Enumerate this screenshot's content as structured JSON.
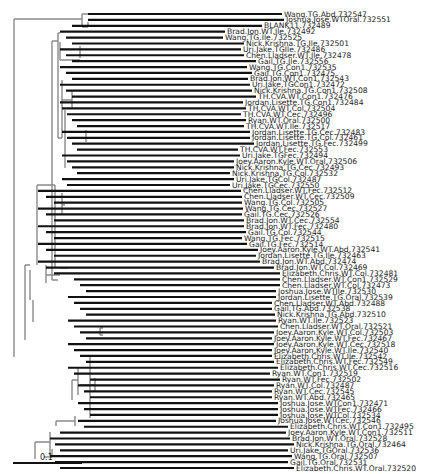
{
  "figure": {
    "type": "phylogenetic-tree",
    "scale_bar": {
      "label": "0.1"
    },
    "colors": {
      "branch": "#111111",
      "internal_branch": "#8a8a8a",
      "label": "#1a1a1a"
    },
    "leaves": [
      {
        "label": "Wang.TG.Abd.732547",
        "len": 282
      },
      {
        "label": "Joshua.Jose.WTOral.732551",
        "len": 284
      },
      {
        "label": "BLANK11.732489",
        "len": 262
      },
      {
        "label": "Brad.Jon.WT.Ile.732492",
        "len": 225
      },
      {
        "label": "Wang.TG.Ile.732525",
        "len": 223
      },
      {
        "label": "Nick.Krishna.TG.Ile.732501",
        "len": 244
      },
      {
        "label": "Uri.Jake.TGIle.732486",
        "len": 241
      },
      {
        "label": "Chen.Lladser.WT.Ile.732478",
        "len": 244
      },
      {
        "label": "Gail.TG.Ile.732556",
        "len": 256
      },
      {
        "label": "Wang.TG.Con1.732535",
        "len": 247
      },
      {
        "label": "Gail.TG.Con1.732475",
        "len": 252
      },
      {
        "label": "Brad.Jon.WT.Con1.732543",
        "len": 248
      },
      {
        "label": "Uri.Jake.TGCon1.732472",
        "len": 250
      },
      {
        "label": "Nick.Krishna.TG.Con1.732508",
        "len": 252
      },
      {
        "label": "TH.CVA.WT.Con1.732476",
        "len": 256
      },
      {
        "label": "Jordan.Lisette.TG.Con1.732484",
        "len": 243
      },
      {
        "label": "TH.CVA.WT.Col.732504",
        "len": 246
      },
      {
        "label": "TH.CVA.WT.Cec.732496",
        "len": 241
      },
      {
        "label": "Ryan.WT.Oral.732500",
        "len": 246
      },
      {
        "label": "TH.CVA.WT.Ile.732517",
        "len": 244
      },
      {
        "label": "Jordan.Lisette.TG.Cec.732483",
        "len": 250
      },
      {
        "label": "Jordan.Lisette.TG.Col.732461",
        "len": 250
      },
      {
        "label": "Jordan.Lisette.TG.Fec.732499",
        "len": 254
      },
      {
        "label": "TH.CVA.WT.Fec.732553",
        "len": 238
      },
      {
        "label": "Uri.Jake.TGFec.732494",
        "len": 240
      },
      {
        "label": "Joey.Aaron.Kyle.WT.Oral.732506",
        "len": 234
      },
      {
        "label": "Nick.Krishna.TG.Cec.732493",
        "len": 234
      },
      {
        "label": "Nick.Krishna.TG.Col.732532",
        "len": 230
      },
      {
        "label": "Uri.Jake.TGCol.732487",
        "len": 234
      },
      {
        "label": "Uri.Jake.TGCec.732550",
        "len": 230
      },
      {
        "label": "Chen.Lladser.WT.Fec.732512",
        "len": 241
      },
      {
        "label": "Chen.Lladser.WT.Cec.732509",
        "len": 242
      },
      {
        "label": "Wang.TG.Col.732505",
        "len": 242
      },
      {
        "label": "Wang.TG.Cec.732527",
        "len": 243
      },
      {
        "label": "Gail.TG.Cec.732526",
        "len": 242
      },
      {
        "label": "Brad.Jon.WT.Cec.732554",
        "len": 244
      },
      {
        "label": "Brad.Jon.WT.Fec.732480",
        "len": 244
      },
      {
        "label": "Gail.TG.Col.732544",
        "len": 246
      },
      {
        "label": "Wang.TG.Fec.732515",
        "len": 242
      },
      {
        "label": "Gail.TG.Fec.732514",
        "len": 247
      },
      {
        "label": "Joey.Aaron.Kyle.WT.Abd.732541",
        "len": 258
      },
      {
        "label": "Jordan.Lisette.TG.Ile.732463",
        "len": 256
      },
      {
        "label": "Brad.Jon.WT.Abd.732474",
        "len": 260
      },
      {
        "label": "Brad.Jon.WT.Col.732469",
        "len": 274
      },
      {
        "label": "Elizabeth.Chris.WT.Col.732481",
        "len": 280
      },
      {
        "label": "Chen.Lladser.WT.Con1.732529",
        "len": 280
      },
      {
        "label": "Chen.Lladser.WT.Col.732473",
        "len": 280
      },
      {
        "label": "Joshua.Jose.WTIle.732530",
        "len": 276
      },
      {
        "label": "Jordan.Lisette.TG.Oral.732539",
        "len": 276
      },
      {
        "label": "Chen.Lladser.WT.Abd.732488",
        "len": 272
      },
      {
        "label": "Gail.TG.Abd.732538",
        "len": 272
      },
      {
        "label": "Nick.Krishna.TG.Abd.732510",
        "len": 275
      },
      {
        "label": "Ryan.WT.Ile.732523",
        "len": 276
      },
      {
        "label": "Chen.Lladser.WT.Oral.732521",
        "len": 278
      },
      {
        "label": "Joey.Aaron.Kyle.WT.Col.732503",
        "len": 274
      },
      {
        "label": "Joey.Aaron.Kyle.WT.Fec.732467",
        "len": 272
      },
      {
        "label": "Joey.Aaron.Kyle.WT.Cec.732518",
        "len": 274
      },
      {
        "label": "Joey.Aaron.Kyle.WT.Ile.732540",
        "len": 272
      },
      {
        "label": "Elizabeth.Chris.WT.Ile.732542",
        "len": 272
      },
      {
        "label": "Elizabeth.Chris.WT.Fec.732549",
        "len": 274
      },
      {
        "label": "Elizabeth.Chris.WT.Cec.732516",
        "len": 278
      },
      {
        "label": "Ryan.WT.Con1.732519",
        "len": 270
      },
      {
        "label": "Ryan.WT.Fec.732502",
        "len": 280
      },
      {
        "label": "Ryan.WT.Col.732487",
        "len": 274
      },
      {
        "label": "Ryan.WT.Cec.732545",
        "len": 272
      },
      {
        "label": "Ryan.WT.Abd.732465",
        "len": 272
      },
      {
        "label": "Joshua.Jose.WTCon1.732471",
        "len": 278
      },
      {
        "label": "Joshua.Jose.WTFec.732466",
        "len": 278
      },
      {
        "label": "Joshua.Jose.WTCol.732534",
        "len": 278
      },
      {
        "label": "Joshua.Jose.WTCec.732546",
        "len": 276
      },
      {
        "label": "Elizabeth.Chris.WT.Con1.732495",
        "len": 288
      },
      {
        "label": "Joey.Aaron.Kyle.WT.Con1.732511",
        "len": 286
      },
      {
        "label": "Brad.Jon.WT.Oral.732528",
        "len": 290
      },
      {
        "label": "Nick.Krishna.TG.Oral.732464",
        "len": 294
      },
      {
        "label": "Uri.Jake.TGOral.732536",
        "len": 288
      },
      {
        "label": "Wang.TG.Oral.732507",
        "len": 292
      },
      {
        "label": "Gail.TG.Oral.732531",
        "len": 288
      },
      {
        "label": "Elizabeth.Chris.WT.Oral.732520",
        "len": 294
      }
    ]
  }
}
